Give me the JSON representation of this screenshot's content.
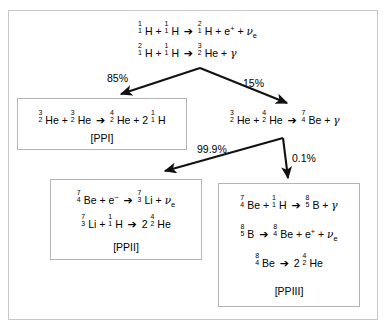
{
  "diagram": {
    "frame_border_color": "#c8c8c8",
    "box_border_color": "#b4b4b4",
    "arrow_color": "#000000",
    "background": "#ffffff"
  },
  "top_equations": [
    {
      "id": "pp1-step1",
      "parts": [
        {
          "t": "nuclide",
          "sup": "1",
          "sub": "1",
          "sym": "H"
        },
        {
          "t": "op",
          "v": "+"
        },
        {
          "t": "nuclide",
          "sup": "1",
          "sub": "1",
          "sym": "H"
        },
        {
          "t": "arrow",
          "v": "➔"
        },
        {
          "t": "nuclide",
          "sup": "2",
          "sub": "1",
          "sym": "H"
        },
        {
          "t": "op",
          "v": "+"
        },
        {
          "t": "particle",
          "v": "e",
          "charge": "+"
        },
        {
          "t": "op",
          "v": "+"
        },
        {
          "t": "neutrino",
          "v": "ν",
          "sub": "e"
        }
      ],
      "plain": "1/1 H + 1/1 H ➔ 2/1 H + e+ + νe"
    },
    {
      "id": "pp1-step2",
      "parts": [
        {
          "t": "nuclide",
          "sup": "2",
          "sub": "1",
          "sym": "H"
        },
        {
          "t": "op",
          "v": "+"
        },
        {
          "t": "nuclide",
          "sup": "1",
          "sub": "1",
          "sym": "H"
        },
        {
          "t": "arrow",
          "v": "➔"
        },
        {
          "t": "nuclide",
          "sup": "3",
          "sub": "2",
          "sym": "He"
        },
        {
          "t": "op",
          "v": "+"
        },
        {
          "t": "gamma",
          "v": "γ"
        }
      ],
      "plain": "2/1 H + 1/1 H ➔ 3/2 He + γ"
    }
  ],
  "branch_labels": {
    "left_primary": "85%",
    "right_primary": "15%",
    "left_secondary": "99.9%",
    "right_secondary": "0.1%"
  },
  "boxes": [
    {
      "id": "ppi",
      "tag": "[PPI]",
      "equations": [
        {
          "parts": [
            {
              "t": "nuclide",
              "sup": "3",
              "sub": "2",
              "sym": "He"
            },
            {
              "t": "op",
              "v": "+"
            },
            {
              "t": "nuclide",
              "sup": "3",
              "sub": "2",
              "sym": "He"
            },
            {
              "t": "arrow",
              "v": "➔"
            },
            {
              "t": "nuclide",
              "sup": "4",
              "sub": "2",
              "sym": "He"
            },
            {
              "t": "op",
              "v": "+"
            },
            {
              "t": "coef",
              "v": "2"
            },
            {
              "t": "nuclide",
              "sup": "1",
              "sub": "1",
              "sym": "H"
            }
          ],
          "plain": "3/2 He + 3/2 He ➔ 4/2 He + 2 1/1 H"
        }
      ]
    },
    {
      "id": "ppii",
      "tag": "[PPII]",
      "equations": [
        {
          "parts": [
            {
              "t": "nuclide",
              "sup": "7",
              "sub": "4",
              "sym": "Be"
            },
            {
              "t": "op",
              "v": "+"
            },
            {
              "t": "particle",
              "v": "e",
              "charge": "−"
            },
            {
              "t": "arrow",
              "v": "➔"
            },
            {
              "t": "nuclide",
              "sup": "7",
              "sub": "3",
              "sym": "Li"
            },
            {
              "t": "op",
              "v": "+"
            },
            {
              "t": "neutrino",
              "v": "ν",
              "sub": "e"
            }
          ],
          "plain": "7/4 Be + e- ➔ 7/3 Li + νe"
        },
        {
          "parts": [
            {
              "t": "nuclide",
              "sup": "7",
              "sub": "3",
              "sym": "Li"
            },
            {
              "t": "op",
              "v": "+"
            },
            {
              "t": "nuclide",
              "sup": "1",
              "sub": "1",
              "sym": "H"
            },
            {
              "t": "arrow",
              "v": "➔"
            },
            {
              "t": "coef",
              "v": "2"
            },
            {
              "t": "nuclide",
              "sup": "4",
              "sub": "2",
              "sym": "He"
            }
          ],
          "plain": "7/3 Li + 1/1 H ➔ 2 4/2 He"
        }
      ]
    },
    {
      "id": "ppiii",
      "tag": "[PPIII]",
      "equations": [
        {
          "parts": [
            {
              "t": "nuclide",
              "sup": "7",
              "sub": "4",
              "sym": "Be"
            },
            {
              "t": "op",
              "v": "+"
            },
            {
              "t": "nuclide",
              "sup": "1",
              "sub": "1",
              "sym": "H"
            },
            {
              "t": "arrow",
              "v": "➔"
            },
            {
              "t": "nuclide",
              "sup": "8",
              "sub": "5",
              "sym": "B"
            },
            {
              "t": "op",
              "v": "+"
            },
            {
              "t": "gamma",
              "v": "γ"
            }
          ],
          "plain": "7/4 Be + 1/1 H ➔ 8/5 B + γ"
        },
        {
          "parts": [
            {
              "t": "nuclide",
              "sup": "8",
              "sub": "5",
              "sym": "B"
            },
            {
              "t": "arrow",
              "v": "➔"
            },
            {
              "t": "nuclide",
              "sup": "8",
              "sub": "4",
              "sym": "Be"
            },
            {
              "t": "op",
              "v": "+"
            },
            {
              "t": "particle",
              "v": "e",
              "charge": "+"
            },
            {
              "t": "op",
              "v": "+"
            },
            {
              "t": "neutrino",
              "v": "ν",
              "sub": "e"
            }
          ],
          "plain": "8/5 B ➔ 8/4 Be + e+ + νe"
        },
        {
          "parts": [
            {
              "t": "nuclide",
              "sup": "8",
              "sub": "4",
              "sym": "Be"
            },
            {
              "t": "arrow",
              "v": "➔"
            },
            {
              "t": "coef",
              "v": "2"
            },
            {
              "t": "nuclide",
              "sup": "4",
              "sub": "2",
              "sym": "He"
            }
          ],
          "plain": "8/4 Be ➔ 2 4/2 He"
        }
      ]
    }
  ],
  "free_equations": [
    {
      "id": "he3-he4",
      "parts": [
        {
          "t": "nuclide",
          "sup": "3",
          "sub": "2",
          "sym": "He"
        },
        {
          "t": "op",
          "v": "+"
        },
        {
          "t": "nuclide",
          "sup": "4",
          "sub": "2",
          "sym": "He"
        },
        {
          "t": "arrow",
          "v": "➔"
        },
        {
          "t": "nuclide",
          "sup": "7",
          "sub": "4",
          "sym": "Be"
        },
        {
          "t": "op",
          "v": "+"
        },
        {
          "t": "gamma",
          "v": "γ"
        }
      ],
      "plain": "3/2 He + 4/2 He ➔ 7/4 Be + γ"
    }
  ]
}
